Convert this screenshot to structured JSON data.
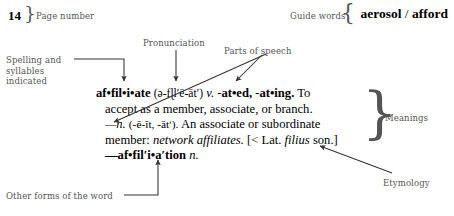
{
  "header": {
    "page_number": "14",
    "page_number_label": "Page number",
    "guide_words_label": "Guide words",
    "guide_word_first": "aerosol",
    "guide_word_separator": "/",
    "guide_word_last": "afford"
  },
  "annotations": {
    "pronunciation": "Pronunciation",
    "parts_of_speech": "Parts of speech",
    "spelling_syllables": "Spelling and syllables indicated",
    "spelling_syllables_line1": "Spelling and",
    "spelling_syllables_line2": "syllables",
    "spelling_syllables_line3": "indicated",
    "meanings": "Meanings",
    "etymology": "Etymology",
    "other_forms": "Other forms of the word"
  },
  "entry": {
    "headword": "af•fil•i•ate",
    "pronunciation": "(ə-fɭlʹē-ātʹ)",
    "part_of_speech_verb": "v.",
    "inflections": "-at•ed, -at•ing.",
    "definition_verb": "To accept as a member, associate, or branch.",
    "part_of_speech_noun": "—n.",
    "noun_pronunciation": "(-ē-ĭt, -ātʹ).",
    "definition_noun": "An associate or subordinate member:",
    "example": "network affiliates.",
    "etymology_open": "[< Lat.",
    "etymology_root": "filius",
    "etymology_gloss": "son.]",
    "derived_form": "—af•filʹi•aʹtion",
    "derived_form_pos": "n."
  },
  "colors": {
    "ink": "#000000",
    "annotation_ink": "#555555",
    "background": "#ffffff"
  }
}
